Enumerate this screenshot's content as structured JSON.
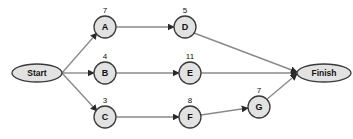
{
  "diagram": {
    "type": "network-diagram",
    "colors": {
      "background": "#ffffff",
      "node_fill": "#e2e2e2",
      "node_stroke": "#3a3a3a",
      "edge": "#8a8a8a",
      "arrowhead": "#2a2a2a",
      "text": "#121212"
    },
    "terminals": [
      {
        "id": "start",
        "label": "Start",
        "cx": 37,
        "cy": 73,
        "rx": 25,
        "ry": 9
      },
      {
        "id": "finish",
        "label": "Finish",
        "cx": 324,
        "cy": 73,
        "rx": 27,
        "ry": 9
      }
    ],
    "nodes": [
      {
        "id": "A",
        "label": "A",
        "duration": "7",
        "cx": 105,
        "cy": 27,
        "r": 11
      },
      {
        "id": "D",
        "label": "D",
        "duration": "5",
        "cx": 185,
        "cy": 27,
        "r": 11
      },
      {
        "id": "B",
        "label": "B",
        "duration": "4",
        "cx": 105,
        "cy": 73,
        "r": 11
      },
      {
        "id": "E",
        "label": "E",
        "duration": "11",
        "cx": 190,
        "cy": 73,
        "r": 11
      },
      {
        "id": "C",
        "label": "C",
        "duration": "3",
        "cx": 105,
        "cy": 117,
        "r": 11
      },
      {
        "id": "F",
        "label": "F",
        "duration": "8",
        "cx": 190,
        "cy": 117,
        "r": 11
      },
      {
        "id": "G",
        "label": "G",
        "duration": "7",
        "cx": 259,
        "cy": 107,
        "r": 11
      }
    ],
    "edges": [
      {
        "id": "start-a",
        "from": "Start",
        "to": "A",
        "x1": 62,
        "y1": 73,
        "x2": 97,
        "y2": 33
      },
      {
        "id": "start-b",
        "from": "Start",
        "to": "B",
        "x1": 62,
        "y1": 73,
        "x2": 94,
        "y2": 73
      },
      {
        "id": "start-c",
        "from": "Start",
        "to": "C",
        "x1": 62,
        "y1": 73,
        "x2": 97,
        "y2": 111
      },
      {
        "id": "a-d",
        "from": "A",
        "to": "D",
        "x1": 116,
        "y1": 27,
        "x2": 174,
        "y2": 27
      },
      {
        "id": "d-finish",
        "from": "D",
        "to": "Finish",
        "x1": 194,
        "y1": 33,
        "x2": 297,
        "y2": 72
      },
      {
        "id": "b-e",
        "from": "B",
        "to": "E",
        "x1": 116,
        "y1": 73,
        "x2": 179,
        "y2": 73
      },
      {
        "id": "e-finish",
        "from": "E",
        "to": "Finish",
        "x1": 201,
        "y1": 73,
        "x2": 297,
        "y2": 73
      },
      {
        "id": "c-f",
        "from": "C",
        "to": "F",
        "x1": 116,
        "y1": 117,
        "x2": 179,
        "y2": 117
      },
      {
        "id": "f-g",
        "from": "F",
        "to": "G",
        "x1": 201,
        "y1": 115,
        "x2": 248,
        "y2": 108
      },
      {
        "id": "g-finish",
        "from": "G",
        "to": "Finish",
        "x1": 266,
        "y1": 100,
        "x2": 297,
        "y2": 74
      }
    ]
  }
}
